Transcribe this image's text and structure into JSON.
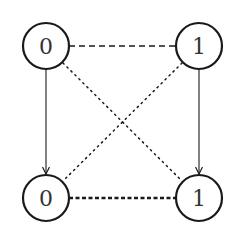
{
  "diagram": {
    "type": "graph",
    "colors": {
      "stroke": "#1a1a1a",
      "background": "#ffffff"
    },
    "nodes": [
      {
        "id": "top-left",
        "label": "0",
        "cx": 46,
        "cy": 46,
        "r": 23
      },
      {
        "id": "top-right",
        "label": "1",
        "cx": 199,
        "cy": 46,
        "r": 23
      },
      {
        "id": "bottom-left",
        "label": "0",
        "cx": 46,
        "cy": 198,
        "r": 23
      },
      {
        "id": "bottom-right",
        "label": "1",
        "cx": 199,
        "cy": 198,
        "r": 23
      }
    ],
    "edges": [
      {
        "from": "top-left",
        "to": "top-right",
        "style": "dashed",
        "arrow": false
      },
      {
        "from": "bottom-left",
        "to": "bottom-right",
        "style": "thick-dotted",
        "arrow": false
      },
      {
        "from": "top-left",
        "to": "bottom-left",
        "style": "solid",
        "arrow": true
      },
      {
        "from": "top-right",
        "to": "bottom-right",
        "style": "solid",
        "arrow": true
      },
      {
        "from": "top-left",
        "to": "bottom-right",
        "style": "dotted",
        "arrow": false
      },
      {
        "from": "top-right",
        "to": "bottom-left",
        "style": "dotted",
        "arrow": false
      }
    ]
  }
}
